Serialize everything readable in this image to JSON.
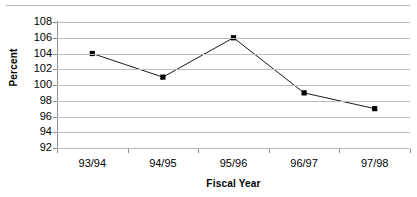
{
  "chart_data": {
    "type": "line",
    "title": "",
    "subtitle": "",
    "xlabel": "Fiscal Year",
    "ylabel": "Percent",
    "categories": [
      "93/94",
      "94/95",
      "95/96",
      "96/97",
      "97/98"
    ],
    "values": [
      104,
      101,
      106,
      99,
      97
    ],
    "series": [
      {
        "name": "Percent",
        "values": [
          104,
          101,
          106,
          99,
          97
        ]
      }
    ],
    "ylim": [
      92,
      108
    ],
    "ytick_step": 2,
    "yticks": [
      108,
      106,
      104,
      102,
      100,
      98,
      96,
      94,
      92
    ],
    "ytick_labels": [
      "108",
      "106",
      "104",
      "102",
      "100",
      "98",
      "96",
      "94",
      "92"
    ],
    "xticks": [
      "93/94",
      "94/95",
      "95/96",
      "96/97",
      "97/98"
    ],
    "grid": "horizontal",
    "legend": "none",
    "annotations": [],
    "marker": "square",
    "colors": {
      "line": "#1a1a1a",
      "marker": "#000000",
      "gridline": "#bcbcbc",
      "axis": "#8d8d8d",
      "text": "#000000",
      "background": "#ffffff",
      "top_rule": "#b9b9b9"
    }
  }
}
